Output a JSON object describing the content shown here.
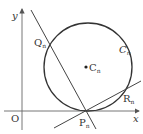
{
  "figure": {
    "axis_x_label": "x",
    "axis_y_label": "y",
    "origin_label": "O",
    "circle_label": "C",
    "circle_label_sub": "n",
    "center_label": "C",
    "center_label_sub": "n",
    "point_P_label": "P",
    "point_P_sub": "n",
    "point_Q_label": "Q",
    "point_Q_sub": "n",
    "point_R_label": "R",
    "point_R_sub": "n",
    "stroke_color": "#333333",
    "axis_color": "#555555"
  }
}
